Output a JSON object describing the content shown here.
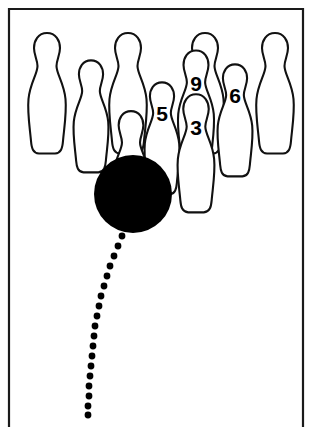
{
  "diagram": {
    "background_color": "#ffffff",
    "ink_color": "#000000",
    "frame": {
      "name": "border-frame",
      "left": 9,
      "top": 9,
      "right": 303,
      "bottom": 427,
      "bottom_open": true,
      "stroke_color": "#1a1a1a"
    },
    "ball": {
      "label": "bowling-ball",
      "color": "#000000",
      "cx": 133,
      "cy": 194,
      "r": 39
    },
    "pins": [
      {
        "id": "pin-back-left-1",
        "number": "",
        "cx": 47,
        "cy": 95,
        "scale": 1.0,
        "z": 1
      },
      {
        "id": "pin-back-left-2",
        "number": "",
        "cx": 91,
        "cy": 118,
        "scale": 0.93,
        "z": 2
      },
      {
        "id": "pin-back-mid-1",
        "number": "",
        "cx": 128,
        "cy": 95,
        "scale": 1.0,
        "z": 1
      },
      {
        "id": "pin-back-right-1",
        "number": "",
        "cx": 205,
        "cy": 95,
        "scale": 1.0,
        "z": 1
      },
      {
        "id": "pin-back-right-2",
        "number": "",
        "cx": 275,
        "cy": 95,
        "scale": 1.0,
        "z": 1
      },
      {
        "id": "pin-5",
        "number": "5",
        "cx": 162,
        "cy": 140,
        "scale": 0.93,
        "z": 3
      },
      {
        "id": "pin-6",
        "number": "6",
        "cx": 235,
        "cy": 122,
        "scale": 0.93,
        "z": 2
      },
      {
        "id": "pin-9",
        "number": "9",
        "cx": 196,
        "cy": 110,
        "scale": 0.96,
        "z": 2
      },
      {
        "id": "pin-3",
        "number": "3",
        "cx": 196,
        "cy": 155,
        "scale": 0.98,
        "z": 4
      },
      {
        "id": "pin-1-headpin",
        "number": "",
        "cx": 131,
        "cy": 170,
        "scale": 0.95,
        "z": 3
      }
    ],
    "ball_path": {
      "label": "ball-trajectory-dotted-path",
      "style": "dotted",
      "dot_color": "#000000",
      "dot_radius": 3.4,
      "points": [
        [
          122,
          236
        ],
        [
          118,
          246
        ],
        [
          114,
          256
        ],
        [
          110,
          266
        ],
        [
          107,
          276
        ],
        [
          104,
          286
        ],
        [
          101,
          296
        ],
        [
          99,
          306
        ],
        [
          97,
          316
        ],
        [
          95,
          326
        ],
        [
          94,
          336
        ],
        [
          93,
          346
        ],
        [
          92,
          356
        ],
        [
          91,
          366
        ],
        [
          90,
          376
        ],
        [
          89,
          386
        ],
        [
          89,
          396
        ],
        [
          88,
          406
        ],
        [
          88,
          415
        ]
      ]
    }
  }
}
